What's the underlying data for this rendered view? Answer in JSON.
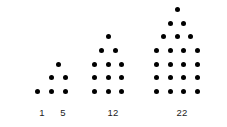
{
  "canvas": {
    "width": 227,
    "height": 127,
    "background": "#ffffff",
    "dot_color": "#000000",
    "label_color": "#1b1b1b"
  },
  "chart_data": {
    "type": "scatter",
    "title": "",
    "subtitle": "",
    "xlabel": "",
    "ylabel": "",
    "categories": [
      "1",
      "5",
      "12",
      "22"
    ],
    "values": [
      1,
      5,
      12,
      22
    ],
    "legend": [],
    "grid": false,
    "figures": [
      {
        "index": 1,
        "label": "1",
        "total_dots": 1,
        "rows": [
          1
        ],
        "left": 31,
        "bottom": 98,
        "label_left": 31,
        "label_top": 107,
        "label_width": 22
      },
      {
        "index": 2,
        "label": "5",
        "total_dots": 5,
        "rows": [
          1,
          2,
          2
        ],
        "left": 45,
        "bottom": 98,
        "label_left": 45,
        "label_top": 107,
        "label_width": 36
      },
      {
        "index": 3,
        "label": "12",
        "total_dots": 12,
        "rows": [
          1,
          2,
          3,
          3,
          3
        ],
        "left": 88,
        "bottom": 98,
        "label_left": 88,
        "label_top": 107,
        "label_width": 50
      },
      {
        "index": 4,
        "label": "22",
        "total_dots": 22,
        "rows": [
          1,
          2,
          3,
          4,
          4,
          4,
          4
        ],
        "left": 150,
        "bottom": 98,
        "label_left": 150,
        "label_top": 107,
        "label_width": 64
      }
    ]
  }
}
